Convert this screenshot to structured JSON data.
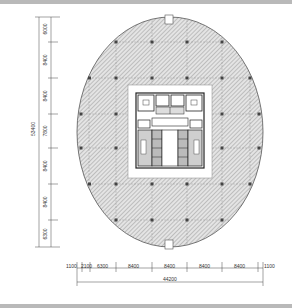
{
  "drawing": {
    "type": "architectural-floor-plan",
    "shape": "ellipse",
    "colors": {
      "hatch": "#9a9a9a",
      "outline": "#555555",
      "column": "#444444",
      "core_fill": "#ffffff",
      "frame": "#b9b9b9"
    }
  },
  "vertical_dimensions": {
    "total": "53400",
    "segments": [
      "6000",
      "8400",
      "8400",
      "7800",
      "8400",
      "8400",
      "6300"
    ]
  },
  "horizontal_dimensions": {
    "total": "44200",
    "segments": [
      "1100",
      "2100",
      "6300",
      "8400",
      "8400",
      "8400",
      "8400",
      "1100"
    ]
  }
}
